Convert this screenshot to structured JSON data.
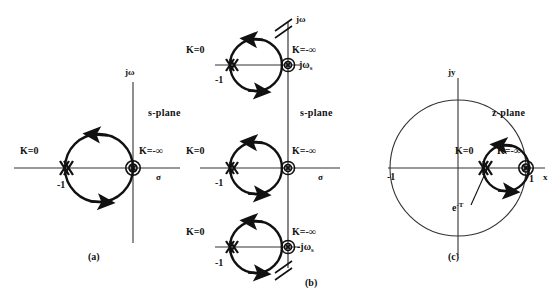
{
  "figure": {
    "stroke_color": "#111111",
    "thin_color": "#333333",
    "background": "#ffffff"
  },
  "panels": [
    {
      "id": "a",
      "caption": "(a)",
      "plane_label": "s-plane",
      "axes": {
        "vertical": "jω",
        "horizontal": "σ"
      },
      "markers": [
        {
          "name": "open-loop-pole-double-at-minus-one",
          "label": "K=0",
          "point_label": "-1",
          "type": "x"
        },
        {
          "name": "zero-at-origin",
          "label": "K=-∞",
          "point_label": "",
          "type": "circled-x"
        }
      ],
      "locus": {
        "type": "circle",
        "direction": "counterclockwise",
        "arrowheads": 2
      }
    },
    {
      "id": "b",
      "caption": "(b)",
      "plane_label": "s-plane",
      "axes": {
        "vertical": "jω",
        "horizontal": "σ"
      },
      "axis_breaks": 2,
      "sections": [
        {
          "name": "upper-strip",
          "k_zero": "K=0",
          "k_infinity": "K=-∞",
          "pole_label": "-1",
          "frequency_label": "jω",
          "frequency_sub": "s"
        },
        {
          "name": "primary-strip",
          "k_zero": "K=0",
          "k_infinity": "K=-∞",
          "pole_label": "-1",
          "frequency_label": "",
          "frequency_sub": ""
        },
        {
          "name": "lower-strip",
          "k_zero": "K=0",
          "k_infinity": "K=-∞",
          "pole_label": "-1",
          "frequency_label": "-jω",
          "frequency_sub": "s"
        }
      ]
    },
    {
      "id": "c",
      "caption": "(c)",
      "plane_label": "z-plane",
      "axes": {
        "vertical": "jy",
        "horizontal": "x"
      },
      "unit_circle": {
        "left_label": "-1",
        "right_label": "1"
      },
      "markers": [
        {
          "name": "pole-at-exp-minus-T",
          "label": "K=0",
          "point_label_base": "e",
          "point_label_exp": "-T",
          "type": "x"
        },
        {
          "name": "zero-at-one",
          "label": "K=-∞",
          "type": "circled-x"
        }
      ],
      "locus": {
        "type": "circle",
        "direction": "counterclockwise",
        "arrowheads": 2
      }
    }
  ]
}
